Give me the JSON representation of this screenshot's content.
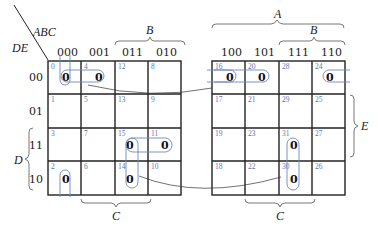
{
  "corner": {
    "row_vars": "DE",
    "col_vars": "ABC"
  },
  "column_labels_left": [
    "000",
    "001",
    "011",
    "010"
  ],
  "column_labels_right": [
    "100",
    "101",
    "111",
    "110"
  ],
  "row_labels": [
    "00",
    "01",
    "11",
    "10"
  ],
  "variable_labels": {
    "A": "A",
    "B_left": "B",
    "B_right": "B",
    "C_left": "C",
    "C_right": "C",
    "D": "D",
    "E": "E"
  },
  "left_map": {
    "cell_numbers": [
      [
        "0",
        "4",
        "12",
        "8"
      ],
      [
        "1",
        "5",
        "13",
        "9"
      ],
      [
        "3",
        "7",
        "15",
        "11"
      ],
      [
        "2",
        "6",
        "14",
        "10"
      ]
    ],
    "values": [
      [
        "0",
        "0",
        "",
        ""
      ],
      [
        "",
        "",
        "",
        ""
      ],
      [
        "",
        "",
        "0",
        "0"
      ],
      [
        "0",
        "",
        "0",
        ""
      ]
    ]
  },
  "right_map": {
    "cell_numbers": [
      [
        "16",
        "20",
        "28",
        "24"
      ],
      [
        "17",
        "21",
        "29",
        "25"
      ],
      [
        "19",
        "23",
        "31",
        "27"
      ],
      [
        "18",
        "22",
        "30",
        "26"
      ]
    ],
    "values": [
      [
        "0",
        "0",
        "",
        "0"
      ],
      [
        "",
        "",
        "",
        ""
      ],
      [
        "",
        "",
        "0",
        ""
      ],
      [
        "",
        "",
        "0",
        ""
      ]
    ]
  },
  "colors": {
    "grid": "#222222",
    "cell_number": "#5a78b4",
    "loop": "#6d86bd"
  }
}
